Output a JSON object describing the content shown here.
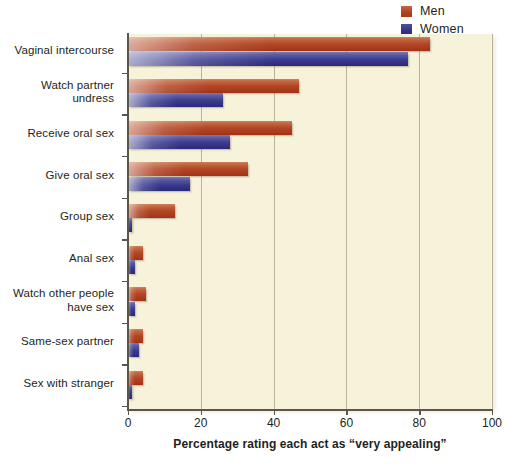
{
  "legend": {
    "position": "top-right",
    "entries": [
      {
        "label": "Men",
        "color": "#b24526",
        "icon": "legend-swatch-men"
      },
      {
        "label": "Women",
        "color": "#3b3b8e",
        "icon": "legend-swatch-women"
      }
    ]
  },
  "chart_data": {
    "type": "bar",
    "orientation": "horizontal",
    "title": "",
    "xlabel": "Percentage rating each act as “very appealing”",
    "ylabel": "",
    "xlim": [
      0,
      100
    ],
    "xticks": [
      0,
      20,
      40,
      60,
      80,
      100
    ],
    "xtick_labels": [
      "0",
      "20",
      "40",
      "60",
      "80",
      "100"
    ],
    "grid": "vertical",
    "background": "#f7f2da",
    "categories": [
      "Vaginal intercourse",
      "Watch partner undress",
      "Receive oral sex",
      "Give oral sex",
      "Group sex",
      "Anal sex",
      "Watch other people have sex",
      "Same-sex partner",
      "Sex with stranger"
    ],
    "category_lines": [
      [
        "Vaginal intercourse"
      ],
      [
        "Watch partner",
        "undress"
      ],
      [
        "Receive oral sex"
      ],
      [
        "Give oral sex"
      ],
      [
        "Group sex"
      ],
      [
        "Anal sex"
      ],
      [
        "Watch other people",
        "have sex"
      ],
      [
        "Same-sex partner"
      ],
      [
        "Sex with stranger"
      ]
    ],
    "series": [
      {
        "name": "Men",
        "color": "#b24526",
        "values": [
          83,
          47,
          45,
          33,
          13,
          4,
          5,
          4,
          4
        ]
      },
      {
        "name": "Women",
        "color": "#3b3b8e",
        "values": [
          77,
          26,
          28,
          17,
          1,
          2,
          2,
          3,
          1
        ]
      }
    ]
  }
}
